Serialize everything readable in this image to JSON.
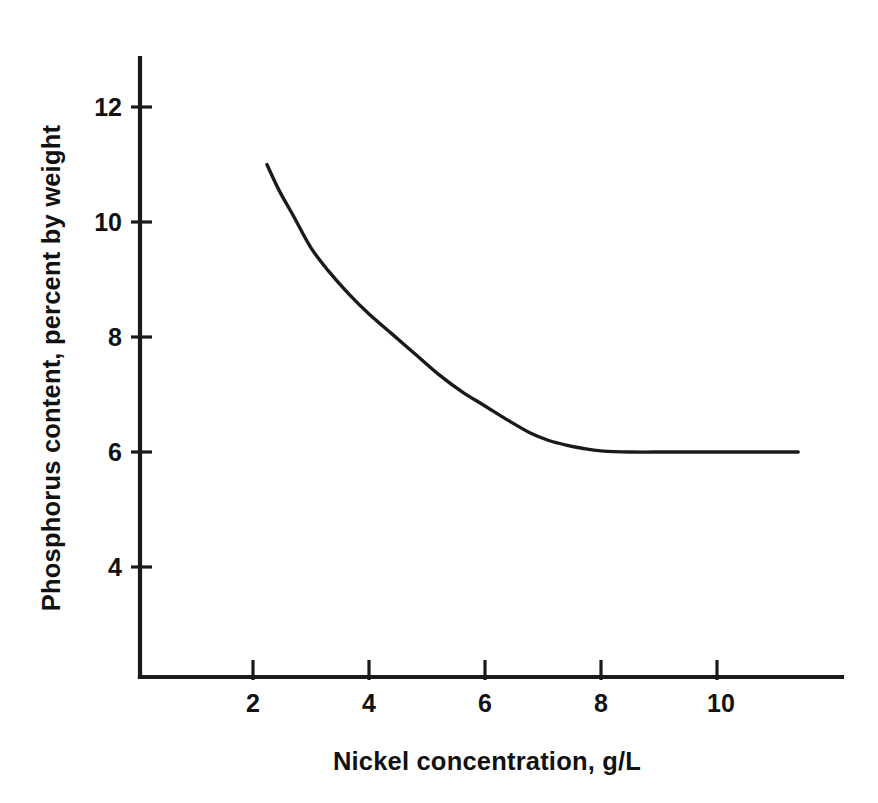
{
  "chart_data": {
    "type": "line",
    "title": "",
    "xlabel": "Nickel concentration, g/L",
    "ylabel": "Phosphorus content, percent by weight",
    "xlim": [
      0.0,
      11.9
    ],
    "ylim": [
      2.8,
      12.85
    ],
    "xticks": [
      2,
      4,
      6,
      8,
      10
    ],
    "xtick_labels": [
      "2",
      "4",
      "6",
      "8",
      "10"
    ],
    "yticks": [
      4,
      6,
      8,
      10,
      12
    ],
    "ytick_labels": [
      "4",
      "6",
      "8",
      "10",
      "12"
    ],
    "grid": false,
    "legend": null,
    "line_color": "#1a1a1a",
    "background_color": "#ffffff",
    "series": [
      {
        "name": "Phosphorus content",
        "x": [
          2.24,
          2.45,
          2.7,
          3.0,
          3.3,
          3.65,
          4.0,
          4.4,
          4.8,
          5.2,
          5.6,
          6.0,
          6.4,
          6.8,
          7.1,
          7.4,
          7.7,
          8.0,
          8.5,
          9.2,
          10.0,
          10.7,
          11.4
        ],
        "y": [
          11.0,
          10.55,
          10.1,
          9.55,
          9.15,
          8.75,
          8.4,
          8.05,
          7.7,
          7.35,
          7.05,
          6.8,
          6.55,
          6.32,
          6.2,
          6.12,
          6.06,
          6.02,
          6.0,
          6.0,
          6.0,
          6.0,
          6.0
        ]
      }
    ]
  },
  "axes": {
    "x_axis_name": "x-axis",
    "y_axis_name": "y-axis"
  }
}
